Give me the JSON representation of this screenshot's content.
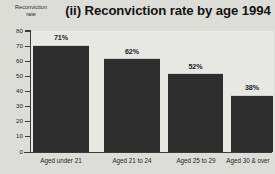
{
  "chart_data": {
    "type": "bar",
    "title": "(ii) Reconviction rate by age 1994",
    "xlabel": "",
    "ylabel": "Reconviction rate",
    "ylim": [
      0,
      80
    ],
    "yticks": [
      "0",
      "10",
      "20",
      "30",
      "40",
      "50",
      "60",
      "70",
      "80"
    ],
    "grid": false,
    "legend": false,
    "categories": [
      "Aged under 21",
      "Aged 21 to 24",
      "Aged 25 to 29",
      "Aged 30 & over"
    ],
    "values": [
      71,
      62,
      52,
      38
    ],
    "value_labels": [
      "71%",
      "62%",
      "52%",
      "38%"
    ],
    "bar_color": "#2e2e2e",
    "plot_background": "#e7e7e4",
    "figure_background": "#dcdcd9",
    "axis_color": "#3a3a3a"
  },
  "axis_title": {
    "line1": "Reconviction",
    "line2": "rate"
  }
}
